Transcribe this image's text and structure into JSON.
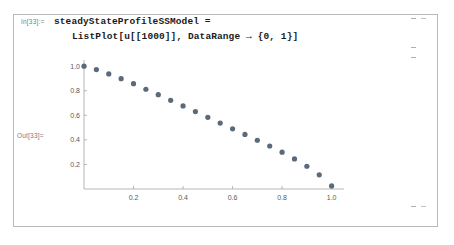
{
  "notebook": {
    "input_cell": {
      "label": "In[33]:=",
      "code_line_1": "steadyStateProfileSSModel =",
      "code_line_2": "ListPlot[u[[1000]], DataRange → {0, 1}]"
    },
    "output_cell": {
      "label": "Out[33]="
    },
    "brackets": {
      "input_bracket": "cell-bracket-input",
      "output_bracket": "cell-bracket-output",
      "group_bracket": "cell-bracket-group"
    }
  },
  "chart_data": {
    "type": "scatter",
    "title": "",
    "xlabel": "",
    "ylabel": "",
    "xlim": [
      0,
      1.05
    ],
    "ylim": [
      0,
      1.05
    ],
    "grid": false,
    "legend": null,
    "marker_color": "#5a6a7a",
    "axis_color": "#999999",
    "xticks": [
      0.2,
      0.4,
      0.6,
      0.8,
      1.0
    ],
    "xtick_labels": [
      "0.2",
      "0.4",
      "0.6",
      "0.8",
      "1.0"
    ],
    "yticks": [
      0.2,
      0.4,
      0.6,
      0.8,
      1.0
    ],
    "ytick_labels": [
      "0.2",
      "0.4",
      "0.6",
      "0.8",
      "1.0"
    ],
    "x": [
      0.0,
      0.05,
      0.1,
      0.15,
      0.2,
      0.25,
      0.3,
      0.35,
      0.4,
      0.45,
      0.5,
      0.55,
      0.6,
      0.65,
      0.7,
      0.75,
      0.8,
      0.85,
      0.9,
      0.95,
      1.0
    ],
    "y": [
      1.0,
      0.972,
      0.937,
      0.898,
      0.857,
      0.812,
      0.768,
      0.722,
      0.676,
      0.63,
      0.583,
      0.537,
      0.49,
      0.444,
      0.397,
      0.35,
      0.3,
      0.245,
      0.185,
      0.115,
      0.025
    ]
  }
}
